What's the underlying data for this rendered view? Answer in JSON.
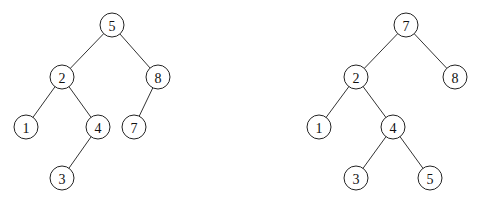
{
  "diagram": {
    "type": "binary-search-trees",
    "node_radius": 12,
    "trees": [
      {
        "name": "left-tree",
        "nodes": [
          {
            "id": "L5",
            "label": "5",
            "x": 112,
            "y": 25
          },
          {
            "id": "L2",
            "label": "2",
            "x": 62,
            "y": 77
          },
          {
            "id": "L8",
            "label": "8",
            "x": 158,
            "y": 77
          },
          {
            "id": "L1",
            "label": "1",
            "x": 26,
            "y": 127
          },
          {
            "id": "L4",
            "label": "4",
            "x": 98,
            "y": 127
          },
          {
            "id": "L7",
            "label": "7",
            "x": 134,
            "y": 127
          },
          {
            "id": "L3",
            "label": "3",
            "x": 62,
            "y": 178
          }
        ],
        "edges": [
          [
            "L5",
            "L2"
          ],
          [
            "L5",
            "L8"
          ],
          [
            "L2",
            "L1"
          ],
          [
            "L2",
            "L4"
          ],
          [
            "L8",
            "L7"
          ],
          [
            "L4",
            "L3"
          ]
        ]
      },
      {
        "name": "right-tree",
        "nodes": [
          {
            "id": "R7",
            "label": "7",
            "x": 406,
            "y": 25
          },
          {
            "id": "R2",
            "label": "2",
            "x": 356,
            "y": 77
          },
          {
            "id": "R8",
            "label": "8",
            "x": 455,
            "y": 77
          },
          {
            "id": "R1",
            "label": "1",
            "x": 319,
            "y": 127
          },
          {
            "id": "R4",
            "label": "4",
            "x": 393,
            "y": 127
          },
          {
            "id": "R3",
            "label": "3",
            "x": 356,
            "y": 178
          },
          {
            "id": "R5",
            "label": "5",
            "x": 430,
            "y": 178
          }
        ],
        "edges": [
          [
            "R7",
            "R2"
          ],
          [
            "R7",
            "R8"
          ],
          [
            "R2",
            "R1"
          ],
          [
            "R2",
            "R4"
          ],
          [
            "R4",
            "R3"
          ],
          [
            "R4",
            "R5"
          ]
        ]
      }
    ]
  }
}
